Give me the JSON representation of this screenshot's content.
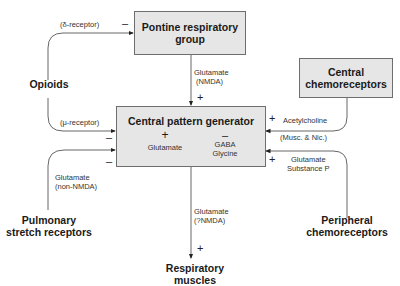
{
  "diagram": {
    "nodes": {
      "pontine": {
        "line1": "Pontine respiratory",
        "line2": "group"
      },
      "central_chemo": {
        "line1": "Central",
        "line2": "chemoreceptors"
      },
      "cpg": {
        "title": "Central pattern generator",
        "excitatory_sign": "+",
        "excitatory_label": "Glutamate",
        "inhibitory_sign": "–",
        "inhibitory_label1": "GABA",
        "inhibitory_label2": "Glycine"
      },
      "opioids": {
        "label": "Opioids"
      },
      "pulmonary": {
        "line1": "Pulmonary",
        "line2": "stretch receptors"
      },
      "peripheral": {
        "line1": "Peripheral",
        "line2": "chemoreceptors"
      },
      "muscles": {
        "line1": "Respiratory",
        "line2": "muscles"
      }
    },
    "edges": {
      "opioids_to_pontine": {
        "label": "(δ-receptor)",
        "sign": "–"
      },
      "opioids_to_cpg": {
        "label": "(μ-receptor)",
        "sign": "–"
      },
      "pontine_to_cpg": {
        "label1": "Glutamate",
        "label2": "(NMDA)",
        "sign": "+"
      },
      "central_chemo_to_cpg": {
        "label1": "Acetylcholine",
        "label2": "(Musc. & Nic.)",
        "sign": "+"
      },
      "pulmonary_to_cpg": {
        "label1": "Glutamate",
        "label2": "(non-NMDA)",
        "sign": "–"
      },
      "peripheral_to_cpg": {
        "label1": "Glutamate",
        "label2": "Substance P",
        "sign": "+"
      },
      "cpg_to_muscles": {
        "label1": "Glutamate",
        "label2": "(?NMDA)",
        "sign": "+"
      }
    },
    "colors": {
      "box_fill": "#e6e6e6",
      "box_border": "#6e6e6e",
      "line": "#555555"
    }
  }
}
